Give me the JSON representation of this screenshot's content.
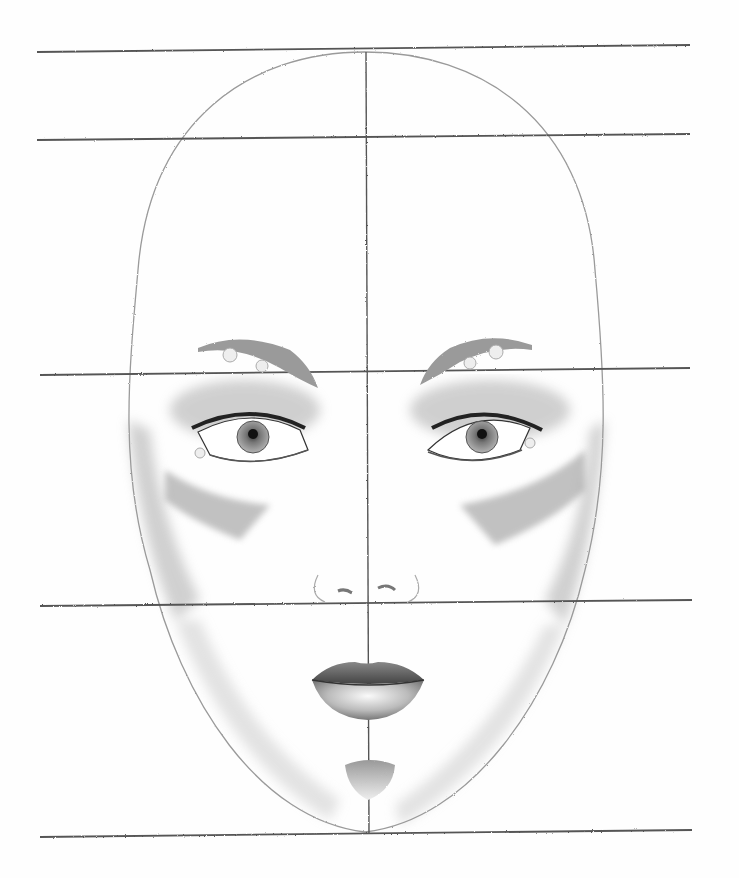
{
  "image": {
    "description": "Pencil drawing of a female face proportion study with horizontal and vertical guidelines",
    "medium": "graphite pencil on white paper",
    "width": 739,
    "height": 878
  },
  "colors": {
    "paper": "#fefefe",
    "guideline": "#555555",
    "outline": "#9a9a9a",
    "shading": "#7a7a7a",
    "dark": "#2a2a2a"
  },
  "guidelines": {
    "horizontal": [
      {
        "name": "top-of-head",
        "y_left": 52,
        "y_right": 45
      },
      {
        "name": "hairline",
        "y_left": 140,
        "y_right": 134
      },
      {
        "name": "brow-line",
        "y_left": 375,
        "y_right": 368
      },
      {
        "name": "nose-base",
        "y_left": 606,
        "y_right": 600
      },
      {
        "name": "chin",
        "y_left": 837,
        "y_right": 830
      }
    ],
    "vertical": {
      "name": "center-line",
      "x": 367,
      "y_top": 52,
      "y_bottom": 834
    }
  },
  "features": [
    "head-outline",
    "eyebrows",
    "eyes",
    "eyeshadow",
    "cheek-contour",
    "nose",
    "lips",
    "chin-shadow"
  ]
}
